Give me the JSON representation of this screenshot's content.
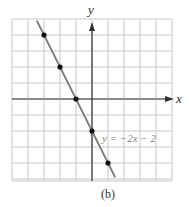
{
  "chart_data": {
    "type": "line",
    "title": "",
    "xlabel": "x",
    "ylabel": "y",
    "xlim": [
      -5,
      5
    ],
    "ylim": [
      -5,
      5
    ],
    "grid": true,
    "grid_step": 1,
    "tick_labels": false,
    "series": [
      {
        "name": "y = -2x - 2",
        "equation": "y = -2x - 2",
        "slope": -2,
        "intercept": -2,
        "points": [
          {
            "x": -3,
            "y": 4
          },
          {
            "x": -2,
            "y": 2
          },
          {
            "x": -1,
            "y": 0
          },
          {
            "x": 0,
            "y": -2
          },
          {
            "x": 1,
            "y": -4
          }
        ]
      }
    ],
    "annotations": [
      {
        "text": "y = -2x - 2",
        "x": 0.7,
        "y": -2.5
      }
    ],
    "caption": "(b)"
  },
  "labels": {
    "x_axis": "x",
    "y_axis": "y",
    "equation": "y = −2x − 2",
    "caption": "(b)"
  },
  "colors": {
    "grid": "#c8c8c8",
    "axis": "#333333",
    "line": "#777777",
    "point": "#111111",
    "equation_text": "#888888"
  }
}
